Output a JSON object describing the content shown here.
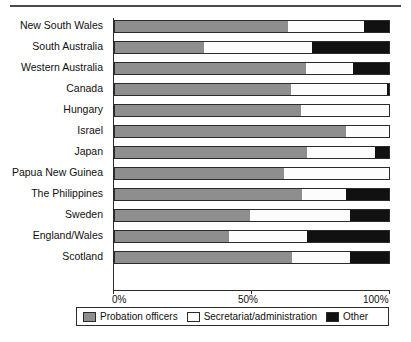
{
  "chart_data": {
    "type": "bar",
    "orientation": "horizontal",
    "stacked": true,
    "normalized": true,
    "title": "",
    "xlabel": "",
    "ylabel": "",
    "xlim": [
      0,
      100
    ],
    "xticks": [
      "0%",
      "50%",
      "100%"
    ],
    "xtick_values": [
      0,
      50,
      100
    ],
    "grid": false,
    "legend_position": "bottom",
    "categories": [
      "New South Wales",
      "South Australia",
      "Western Australia",
      "Canada",
      "Hungary",
      "Israel",
      "Japan",
      "Papua New Guinea",
      "The Philippines",
      "Sweden",
      "England/Wales",
      "Scotland"
    ],
    "series": [
      {
        "name": "Probation officers",
        "color": "#8e8e8e",
        "values": [
          63.0,
          32.7,
          69.6,
          64.3,
          67.6,
          84.0,
          69.8,
          61.7,
          68.2,
          49.1,
          41.5,
          64.5
        ]
      },
      {
        "name": "Secretariat/administration",
        "color": "#fcfcfc",
        "values": [
          27.6,
          39.2,
          16.9,
          34.5,
          32.4,
          16.0,
          24.9,
          38.3,
          15.8,
          36.3,
          28.5,
          21.0
        ]
      },
      {
        "name": "Other",
        "color": "#111111",
        "values": [
          9.4,
          28.1,
          13.5,
          1.2,
          0.0,
          0.0,
          5.3,
          0.0,
          16.0,
          14.6,
          30.0,
          14.5
        ]
      }
    ]
  },
  "legend": {
    "items": [
      {
        "label": "Probation officers",
        "color": "#8e8e8e"
      },
      {
        "label": "Secretariat/administration",
        "color": "#fcfcfc"
      },
      {
        "label": "Other",
        "color": "#111111"
      }
    ]
  }
}
